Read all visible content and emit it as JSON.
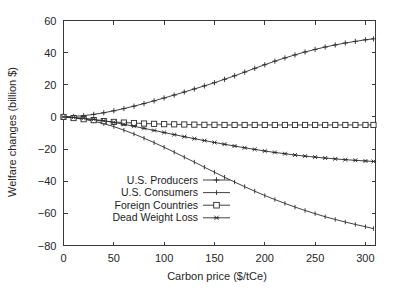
{
  "chart_data": {
    "type": "line",
    "title": "",
    "xlabel": "Carbon price ($/tCe)",
    "ylabel": "Welfare changes (billion $)",
    "xlim": [
      0,
      310
    ],
    "ylim": [
      -80,
      60
    ],
    "xticks": [
      0,
      50,
      100,
      150,
      200,
      250,
      300
    ],
    "xticklabels": [
      "0",
      "50",
      "100",
      "150",
      "200",
      "250",
      "300"
    ],
    "yticks": [
      -80,
      -60,
      -40,
      -20,
      0,
      20,
      40,
      60
    ],
    "yticklabels": [
      "−80",
      "−60",
      "−40",
      "−20",
      "0",
      "20",
      "40",
      "60"
    ],
    "grid": false,
    "legend_position": "lower-left-inside",
    "x": [
      0,
      10,
      20,
      30,
      40,
      50,
      60,
      70,
      80,
      90,
      100,
      110,
      120,
      130,
      140,
      150,
      160,
      170,
      180,
      190,
      200,
      210,
      220,
      230,
      240,
      250,
      260,
      270,
      280,
      290,
      300,
      308
    ],
    "series": [
      {
        "name": "U.S. Producers",
        "marker": "plus",
        "values": [
          0,
          0.3,
          0.8,
          1.6,
          2.6,
          3.8,
          5.2,
          6.7,
          8.3,
          10.0,
          11.8,
          13.6,
          15.5,
          17.4,
          19.3,
          21.3,
          23.4,
          25.6,
          27.9,
          30.2,
          32.5,
          34.7,
          36.7,
          38.6,
          40.4,
          42.0,
          43.5,
          44.8,
          46.0,
          47.0,
          48.0,
          48.6
        ]
      },
      {
        "name": "U.S. Consumers",
        "marker": "line",
        "values": [
          0,
          -0.5,
          -1.4,
          -2.6,
          -4.2,
          -6.0,
          -8.2,
          -10.6,
          -13.2,
          -16.0,
          -18.9,
          -21.9,
          -25.0,
          -28.1,
          -31.3,
          -34.4,
          -37.5,
          -40.5,
          -43.4,
          -46.2,
          -48.9,
          -51.4,
          -53.8,
          -56.1,
          -58.2,
          -60.2,
          -62.1,
          -63.8,
          -65.4,
          -66.9,
          -68.3,
          -69.5
        ]
      },
      {
        "name": "Foreign Countries",
        "marker": "square",
        "values": [
          0,
          -0.7,
          -1.4,
          -2.0,
          -2.6,
          -3.1,
          -3.5,
          -3.8,
          -4.1,
          -4.3,
          -4.5,
          -4.6,
          -4.7,
          -4.8,
          -4.9,
          -4.9,
          -5.0,
          -5.0,
          -5.0,
          -5.0,
          -5.0,
          -5.0,
          -5.0,
          -5.0,
          -5.0,
          -5.0,
          -5.0,
          -5.0,
          -5.0,
          -5.0,
          -5.0,
          -5.0
        ]
      },
      {
        "name": "Dead Weight Loss",
        "marker": "asterisk",
        "values": [
          0,
          -0.3,
          -0.8,
          -1.5,
          -2.4,
          -3.4,
          -4.6,
          -5.8,
          -7.1,
          -8.4,
          -9.7,
          -11.0,
          -12.3,
          -13.5,
          -14.7,
          -15.9,
          -17.0,
          -18.1,
          -19.2,
          -20.2,
          -21.2,
          -22.1,
          -22.9,
          -23.7,
          -24.4,
          -25.0,
          -25.6,
          -26.1,
          -26.6,
          -27.0,
          -27.4,
          -27.7
        ]
      }
    ]
  },
  "legend": {
    "items": [
      {
        "label": "U.S. Producers",
        "marker": "plus"
      },
      {
        "label": "U.S. Consumers",
        "marker": "line"
      },
      {
        "label": "Foreign Countries",
        "marker": "square"
      },
      {
        "label": "Dead Weight Loss",
        "marker": "asterisk"
      }
    ]
  }
}
